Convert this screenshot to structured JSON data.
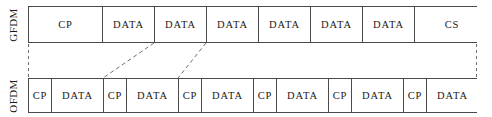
{
  "diagram": {
    "rows": [
      {
        "key": "gfdm",
        "label": "GFDM",
        "cells": [
          {
            "label": "CP",
            "width": 74
          },
          {
            "label": "DATA",
            "width": 52
          },
          {
            "label": "DATA",
            "width": 52
          },
          {
            "label": "DATA",
            "width": 52
          },
          {
            "label": "DATA",
            "width": 52
          },
          {
            "label": "DATA",
            "width": 52
          },
          {
            "label": "DATA",
            "width": 52
          },
          {
            "label": "CS",
            "width": 74
          }
        ]
      },
      {
        "key": "ofdm",
        "label": "OFDM",
        "cells": [
          {
            "label": "CP",
            "width": 23
          },
          {
            "label": "DATA",
            "width": 52
          },
          {
            "label": "CP",
            "width": 23
          },
          {
            "label": "DATA",
            "width": 52
          },
          {
            "label": "CP",
            "width": 23
          },
          {
            "label": "DATA",
            "width": 52
          },
          {
            "label": "CP",
            "width": 23
          },
          {
            "label": "DATA",
            "width": 52
          },
          {
            "label": "CP",
            "width": 23
          },
          {
            "label": "DATA",
            "width": 52
          },
          {
            "label": "CP",
            "width": 23
          },
          {
            "label": "DATA",
            "width": 51
          }
        ]
      }
    ],
    "connectors": [
      {
        "name": "left-edge",
        "kind": "vertical",
        "x1": 28.5,
        "y1": 44,
        "x2": 28.5,
        "y2": 78
      },
      {
        "name": "right-edge",
        "kind": "vertical",
        "x1": 476.5,
        "y1": 44,
        "x2": 476.5,
        "y2": 78
      },
      {
        "name": "diagonal-one",
        "kind": "diagonal",
        "x1": 154,
        "y1": 43,
        "x2": 103,
        "y2": 78
      },
      {
        "name": "diagonal-two",
        "kind": "diagonal",
        "x1": 206,
        "y1": 43,
        "x2": 178,
        "y2": 78
      }
    ],
    "colors": {
      "border": "#4a4a4a",
      "text": "#1a1a1a",
      "dash": "#6e6e6e",
      "background": "#ffffff"
    }
  }
}
